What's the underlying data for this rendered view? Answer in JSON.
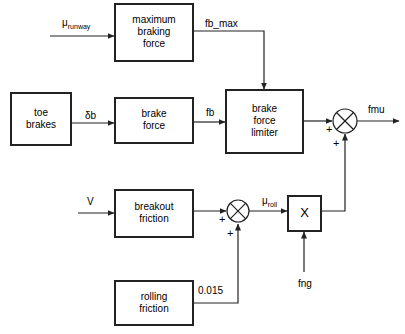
{
  "diagram": {
    "stroke_color": "#222222",
    "text_color": "#000000",
    "background": "#ffffff",
    "blocks": [
      {
        "id": "maximum-braking-force",
        "label": "maximum\nbraking\nforce",
        "x": 115,
        "y": 4,
        "w": 78,
        "h": 57
      },
      {
        "id": "toe-brakes",
        "label": "toe\nbrakes",
        "x": 11,
        "y": 93,
        "w": 60,
        "h": 52
      },
      {
        "id": "brake-force",
        "label": "brake\nforce",
        "x": 115,
        "y": 98,
        "w": 78,
        "h": 45
      },
      {
        "id": "brake-force-limiter",
        "label": "brake\nforce\nlimiter",
        "x": 226,
        "y": 90,
        "w": 77,
        "h": 63
      },
      {
        "id": "breakout-friction",
        "label": "breakout\nfriction",
        "x": 115,
        "y": 190,
        "w": 78,
        "h": 47
      },
      {
        "id": "rolling-friction",
        "label": "rolling\nfriction",
        "x": 115,
        "y": 281,
        "w": 78,
        "h": 44
      },
      {
        "id": "multiplier",
        "label": "X",
        "x": 288,
        "y": 196,
        "w": 33,
        "h": 35
      }
    ],
    "junctions": [
      {
        "id": "sum-output",
        "cx": 345,
        "cy": 121,
        "r": 12
      },
      {
        "id": "sum-roll",
        "cx": 238,
        "cy": 211,
        "r": 11
      }
    ],
    "signal_labels": [
      {
        "id": "mu-runway",
        "text": "μ",
        "sub": "runway",
        "x": 62,
        "y": 17
      },
      {
        "id": "fb-max",
        "text": "fb_max",
        "sub": "",
        "x": 205,
        "y": 18
      },
      {
        "id": "delta-b",
        "text": "δb",
        "sub": "",
        "x": 85,
        "y": 110
      },
      {
        "id": "fb",
        "text": "fb",
        "sub": "",
        "x": 206,
        "y": 107
      },
      {
        "id": "fmu",
        "text": "fmu",
        "sub": "",
        "x": 368,
        "y": 104
      },
      {
        "id": "v-speed",
        "text": "V",
        "sub": "",
        "x": 87,
        "y": 196
      },
      {
        "id": "mu-roll",
        "text": "μ",
        "sub": "roll",
        "x": 262,
        "y": 195
      },
      {
        "id": "constant-0015",
        "text": "0.015",
        "sub": "",
        "x": 198,
        "y": 285
      },
      {
        "id": "fng",
        "text": "fng",
        "sub": "",
        "x": 298,
        "y": 278
      }
    ],
    "plus_signs": [
      {
        "id": "plus-sum-output-left",
        "x": 326,
        "y": 124
      },
      {
        "id": "plus-sum-output-bottom",
        "x": 333,
        "y": 138
      },
      {
        "id": "plus-sum-roll-left",
        "x": 219,
        "y": 214
      },
      {
        "id": "plus-sum-roll-bottom",
        "x": 227,
        "y": 228
      }
    ],
    "connections": [
      {
        "id": "mu-runway-to-max-braking",
        "from": "input",
        "to": "maximum-braking-force"
      },
      {
        "id": "max-braking-to-limiter",
        "from": "maximum-braking-force",
        "to": "brake-force-limiter",
        "signal": "fb_max"
      },
      {
        "id": "toe-brakes-to-brake-force",
        "from": "toe-brakes",
        "to": "brake-force",
        "signal": "δb"
      },
      {
        "id": "brake-force-to-limiter",
        "from": "brake-force",
        "to": "brake-force-limiter",
        "signal": "fb"
      },
      {
        "id": "limiter-to-sum-output",
        "from": "brake-force-limiter",
        "to": "sum-output"
      },
      {
        "id": "sum-output-to-fmu",
        "from": "sum-output",
        "to": "output",
        "signal": "fmu"
      },
      {
        "id": "v-to-breakout-friction",
        "from": "input",
        "to": "breakout-friction",
        "signal": "V"
      },
      {
        "id": "breakout-to-sum-roll",
        "from": "breakout-friction",
        "to": "sum-roll"
      },
      {
        "id": "rolling-friction-to-sum-roll",
        "from": "rolling-friction",
        "to": "sum-roll",
        "signal": "0.015"
      },
      {
        "id": "sum-roll-to-multiplier",
        "from": "sum-roll",
        "to": "multiplier",
        "signal": "μroll"
      },
      {
        "id": "fng-to-multiplier",
        "from": "input",
        "to": "multiplier",
        "signal": "fng"
      },
      {
        "id": "multiplier-to-sum-output",
        "from": "multiplier",
        "to": "sum-output"
      }
    ]
  }
}
